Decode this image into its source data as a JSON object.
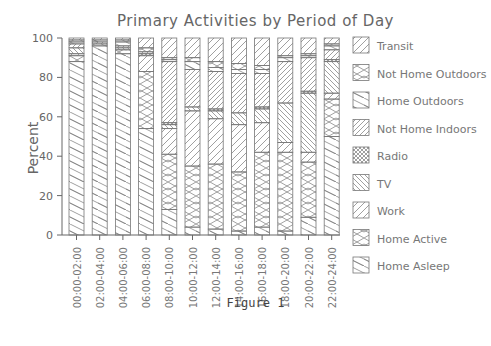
{
  "chart_data": {
    "type": "bar",
    "stacked": true,
    "title": "Primary Activities by Period of Day",
    "xlabel": "",
    "ylabel": "Percent",
    "ylim": [
      0,
      100
    ],
    "yticks": [
      0,
      20,
      40,
      60,
      80,
      100
    ],
    "grid": false,
    "legend_position": "right",
    "caption": "Figure 1",
    "categories": [
      "00:00-02:00",
      "02:00-04:00",
      "04:00-06:00",
      "06:00-08:00",
      "08:00-10:00",
      "10:00-12:00",
      "12:00-14:00",
      "14:00-16:00",
      "16:00-18:00",
      "18:00-20:00",
      "20:00-22:00",
      "22:00-24:00"
    ],
    "series": [
      {
        "name": "Home Asleep",
        "pattern": "diag-down-sparse",
        "values": [
          88,
          96,
          92,
          54,
          13,
          4,
          3,
          2,
          4,
          2,
          9,
          50
        ]
      },
      {
        "name": "Home Active",
        "pattern": "cross-hatch",
        "values": [
          3,
          1,
          2,
          29,
          28,
          31,
          33,
          30,
          38,
          40,
          28,
          19
        ]
      },
      {
        "name": "Work",
        "pattern": "diag-up-sparse",
        "values": [
          1,
          0,
          0,
          8,
          13,
          28,
          23,
          24,
          15,
          5,
          5,
          3
        ]
      },
      {
        "name": "TV",
        "pattern": "diag-down-dense",
        "values": [
          3,
          0,
          1,
          0,
          2,
          2,
          4,
          6,
          7,
          20,
          30,
          16
        ]
      },
      {
        "name": "Radio",
        "pattern": "cross-dense",
        "values": [
          0,
          0,
          0,
          1,
          1,
          0,
          1,
          0,
          1,
          0,
          1,
          1
        ]
      },
      {
        "name": "Not Home Indoors",
        "pattern": "diag-up-dense",
        "values": [
          2,
          1,
          1,
          1,
          31,
          19,
          19,
          20,
          17,
          21,
          17,
          5
        ]
      },
      {
        "name": "Home Outdoors",
        "pattern": "diag-down-sparse",
        "values": [
          1,
          1,
          2,
          0,
          1,
          4,
          2,
          2,
          2,
          2,
          1,
          2
        ]
      },
      {
        "name": "Not Home Outdoors",
        "pattern": "cross-hatch",
        "values": [
          1,
          0,
          1,
          2,
          1,
          2,
          3,
          3,
          2,
          1,
          1,
          1
        ]
      },
      {
        "name": "Transit",
        "pattern": "diag-up-sparse",
        "values": [
          1,
          1,
          1,
          5,
          10,
          10,
          12,
          13,
          14,
          9,
          8,
          3
        ]
      }
    ],
    "legend": [
      "Transit",
      "Not Home Outdoors",
      "Home Outdoors",
      "Not Home Indoors",
      "Radio",
      "TV",
      "Work",
      "Home Active",
      "Home Asleep"
    ]
  }
}
